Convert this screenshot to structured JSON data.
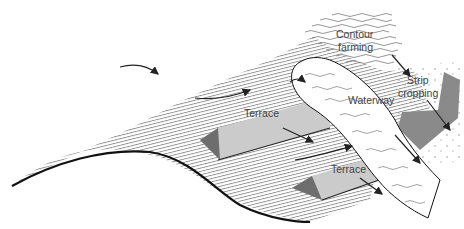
{
  "diagram": {
    "type": "soil-conservation-landscape",
    "labels": {
      "contour_farming_line1": "Contour",
      "contour_farming_line2": "farming",
      "strip_cropping_line1": "Strip",
      "strip_cropping_line2": "cropping",
      "waterway": "Waterway",
      "terrace_upper": "Terrace",
      "terrace_lower": "Terrace"
    },
    "colors": {
      "hatch": "#555555",
      "terrace_fill": "#c8c8c8",
      "terrace_shadow": "#6e6e6e",
      "strip_dark": "#8a8a8a",
      "outline": "#111111",
      "waterway_fill": "#ffffff"
    }
  }
}
